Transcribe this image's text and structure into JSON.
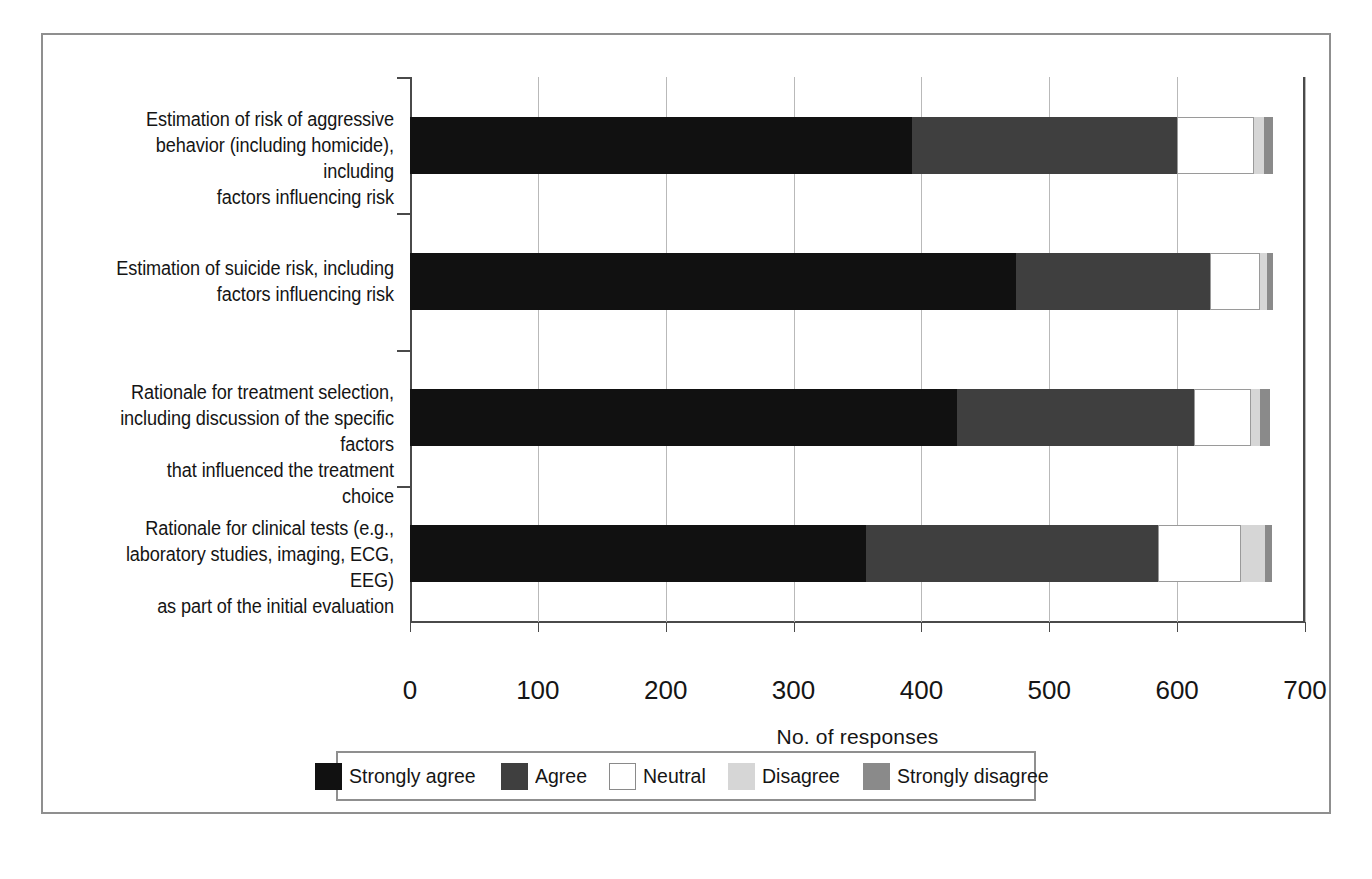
{
  "chart_data": {
    "type": "bar",
    "orientation": "horizontal",
    "stacked": true,
    "title": "",
    "xlabel": "No. of responses",
    "ylabel": "",
    "xlim": [
      0,
      700
    ],
    "xticks": [
      0,
      100,
      200,
      300,
      400,
      500,
      600,
      700
    ],
    "xtick_labels": [
      "0",
      "100",
      "200",
      "300",
      "400",
      "500",
      "600",
      "700"
    ],
    "grid": "vertical",
    "legend_position": "bottom",
    "categories": [
      "Estimation of risk of aggressive behavior (including homicide), including factors influencing risk",
      "Estimation of suicide risk, including factors influencing risk",
      "Rationale for treatment selection, including discussion of the specific factors that influenced the treatment choice",
      "Rationale for clinical tests (e.g., laboratory studies, imaging, ECG, EEG) as part of the initial evaluation"
    ],
    "category_lines": [
      [
        "Estimation of risk of aggressive",
        "behavior (including homicide), including",
        "factors influencing risk"
      ],
      [
        "Estimation of suicide risk, including",
        "factors influencing risk"
      ],
      [
        "Rationale for treatment selection,",
        "including discussion of the specific factors",
        "that influenced the treatment choice"
      ],
      [
        "Rationale for clinical tests (e.g.,",
        "laboratory studies, imaging, ECG, EEG)",
        "as part of the initial evaluation"
      ]
    ],
    "series": [
      {
        "name": "Strongly agree",
        "color": "#111111",
        "values": [
          393,
          474,
          428,
          357
        ]
      },
      {
        "name": "Agree",
        "color": "#3f3f3f",
        "values": [
          207,
          152,
          185,
          228
        ]
      },
      {
        "name": "Neutral",
        "color": "#ffffff",
        "values": [
          60,
          39,
          45,
          65
        ]
      },
      {
        "name": "Disagree",
        "color": "#d6d6d6",
        "values": [
          8,
          5,
          7,
          19
        ]
      },
      {
        "name": "Strongly disagree",
        "color": "#8a8a8a",
        "values": [
          7,
          5,
          8,
          5
        ]
      }
    ],
    "totals": [
      675,
      675,
      673,
      674
    ]
  },
  "legend": {
    "items": [
      {
        "label": "Strongly agree",
        "color": "#111111",
        "outline": false
      },
      {
        "label": "Agree",
        "color": "#3f3f3f",
        "outline": false
      },
      {
        "label": "Neutral",
        "color": "#ffffff",
        "outline": true
      },
      {
        "label": "Disagree",
        "color": "#d6d6d6",
        "outline": false
      },
      {
        "label": "Strongly disagree",
        "color": "#8a8a8a",
        "outline": false
      }
    ]
  },
  "axis": {
    "x_title": "No. of responses"
  }
}
